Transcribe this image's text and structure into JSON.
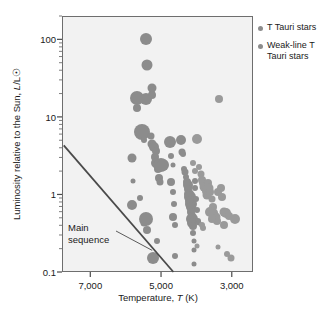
{
  "chart_data": {
    "type": "scatter",
    "title": "",
    "xlabel": "Temperature, T (K)",
    "ylabel": "Luminosity relative to the Sun, L/L☉",
    "xlabel_parts": {
      "pre": "Temperature, ",
      "sym": "T",
      "post": " (K)"
    },
    "ylabel_parts": {
      "pre": "Luminosity relative to the Sun, ",
      "sym": "L",
      "post": "/L☉"
    },
    "xscale": "linear",
    "yscale": "log",
    "x_inverted": true,
    "xlim": [
      7800,
      2400
    ],
    "ylim": [
      0.1,
      200
    ],
    "grid": false,
    "xticks": [
      7000,
      5000,
      3000
    ],
    "xtick_labels": [
      "7,000",
      "5,000",
      "3,000"
    ],
    "yticks": [
      0.1,
      1,
      10,
      100
    ],
    "ytick_labels": [
      "0.1",
      "1",
      "10",
      "100"
    ],
    "y_minor_ticks": [
      0.2,
      0.3,
      0.4,
      0.5,
      0.6,
      0.7,
      0.8,
      0.9,
      2,
      3,
      4,
      5,
      6,
      7,
      8,
      9,
      20,
      30,
      40,
      50,
      60,
      70,
      80,
      90,
      200
    ],
    "legend_position": "right-top",
    "legend": [
      {
        "name": "T Tauri stars",
        "color": "#8c8c8c"
      },
      {
        "name": "Weak-line T Tauri stars",
        "color": "#9a9a9a"
      }
    ],
    "annotations": [
      {
        "text_line1": "Main",
        "text_line2": "sequence",
        "points_to": [
          5250,
          0.19
        ]
      }
    ],
    "main_sequence_line": {
      "x": [
        7750,
        4650
      ],
      "y": [
        4.3,
        0.1
      ]
    },
    "series": [
      {
        "name": "T Tauri stars",
        "color": "#8c8c8c",
        "points": [
          {
            "x": 5450,
            "y": 105,
            "s": 6
          },
          {
            "x": 5430,
            "y": 48,
            "s": 5.5
          },
          {
            "x": 5700,
            "y": 18,
            "s": 7
          },
          {
            "x": 5700,
            "y": 13.5,
            "s": 4
          },
          {
            "x": 5450,
            "y": 17.5,
            "s": 6
          },
          {
            "x": 5270,
            "y": 24,
            "s": 4.5
          },
          {
            "x": 5270,
            "y": 20,
            "s": 4
          },
          {
            "x": 5560,
            "y": 6.6,
            "s": 8
          },
          {
            "x": 5520,
            "y": 5.2,
            "s": 3
          },
          {
            "x": 5300,
            "y": 5.8,
            "s": 3.5
          },
          {
            "x": 5280,
            "y": 4.6,
            "s": 4.5
          },
          {
            "x": 5230,
            "y": 4.2,
            "s": 5
          },
          {
            "x": 5180,
            "y": 3.7,
            "s": 4
          },
          {
            "x": 5210,
            "y": 3.1,
            "s": 4
          },
          {
            "x": 5160,
            "y": 2.6,
            "s": 5
          },
          {
            "x": 5120,
            "y": 2.2,
            "s": 4
          },
          {
            "x": 5080,
            "y": 2.5,
            "s": 6
          },
          {
            "x": 5020,
            "y": 2.45,
            "s": 7
          },
          {
            "x": 4980,
            "y": 2.5,
            "s": 6
          },
          {
            "x": 5100,
            "y": 1.7,
            "s": 4
          },
          {
            "x": 5060,
            "y": 1.5,
            "s": 3.5
          },
          {
            "x": 5840,
            "y": 3.0,
            "s": 4.5
          },
          {
            "x": 5830,
            "y": 1.55,
            "s": 2.5
          },
          {
            "x": 5850,
            "y": 0.75,
            "s": 5
          },
          {
            "x": 5620,
            "y": 0.93,
            "s": 3
          },
          {
            "x": 5520,
            "y": 0.44,
            "s": 3.5
          },
          {
            "x": 5440,
            "y": 0.5,
            "s": 7
          },
          {
            "x": 5420,
            "y": 0.36,
            "s": 4
          },
          {
            "x": 5260,
            "y": 0.155,
            "s": 6
          },
          {
            "x": 5150,
            "y": 0.26,
            "s": 3
          },
          {
            "x": 4780,
            "y": 4.9,
            "s": 6
          },
          {
            "x": 4760,
            "y": 3.2,
            "s": 3
          },
          {
            "x": 4700,
            "y": 2.5,
            "s": 2.5
          },
          {
            "x": 4740,
            "y": 1.5,
            "s": 4
          },
          {
            "x": 4700,
            "y": 1.1,
            "s": 3
          },
          {
            "x": 4660,
            "y": 0.78,
            "s": 3
          },
          {
            "x": 4690,
            "y": 0.52,
            "s": 4
          },
          {
            "x": 4640,
            "y": 0.42,
            "s": 3
          },
          {
            "x": 4620,
            "y": 0.165,
            "s": 3
          },
          {
            "x": 4450,
            "y": 5.2,
            "s": 5
          },
          {
            "x": 4430,
            "y": 3.6,
            "s": 3.5
          },
          {
            "x": 4400,
            "y": 3.4,
            "s": 3
          },
          {
            "x": 4380,
            "y": 2.2,
            "s": 3
          },
          {
            "x": 4350,
            "y": 2.0,
            "s": 3.5
          },
          {
            "x": 4330,
            "y": 1.75,
            "s": 3
          },
          {
            "x": 4300,
            "y": 1.5,
            "s": 4
          },
          {
            "x": 4280,
            "y": 1.35,
            "s": 5
          },
          {
            "x": 4260,
            "y": 1.2,
            "s": 4
          },
          {
            "x": 4240,
            "y": 1.05,
            "s": 5
          },
          {
            "x": 4220,
            "y": 0.95,
            "s": 6
          },
          {
            "x": 4200,
            "y": 0.85,
            "s": 5
          },
          {
            "x": 4190,
            "y": 0.78,
            "s": 6
          },
          {
            "x": 4180,
            "y": 0.72,
            "s": 5
          },
          {
            "x": 4170,
            "y": 0.62,
            "s": 4
          },
          {
            "x": 4160,
            "y": 0.55,
            "s": 4
          },
          {
            "x": 4150,
            "y": 0.5,
            "s": 6
          },
          {
            "x": 4140,
            "y": 0.44,
            "s": 5
          },
          {
            "x": 4130,
            "y": 0.4,
            "s": 4
          },
          {
            "x": 4120,
            "y": 0.33,
            "s": 3
          },
          {
            "x": 4110,
            "y": 0.26,
            "s": 2.5
          },
          {
            "x": 4100,
            "y": 0.2,
            "s": 2.5
          },
          {
            "x": 4090,
            "y": 0.13,
            "s": 2.5
          },
          {
            "x": 4080,
            "y": 1.55,
            "s": 3
          },
          {
            "x": 4060,
            "y": 1.25,
            "s": 3
          },
          {
            "x": 4040,
            "y": 0.9,
            "s": 3
          },
          {
            "x": 4020,
            "y": 0.64,
            "s": 3
          },
          {
            "x": 3990,
            "y": 0.47,
            "s": 3
          },
          {
            "x": 3960,
            "y": 0.44,
            "s": 2.5
          }
        ]
      },
      {
        "name": "Weak-line T Tauri stars",
        "color": "#9a9a9a",
        "points": [
          {
            "x": 3380,
            "y": 17.5,
            "s": 4
          },
          {
            "x": 4010,
            "y": 5.3,
            "s": 5
          },
          {
            "x": 3960,
            "y": 2.35,
            "s": 3
          },
          {
            "x": 3900,
            "y": 1.9,
            "s": 3.5
          },
          {
            "x": 3870,
            "y": 1.6,
            "s": 4
          },
          {
            "x": 3840,
            "y": 1.45,
            "s": 4
          },
          {
            "x": 3800,
            "y": 1.3,
            "s": 4.5
          },
          {
            "x": 3770,
            "y": 1.15,
            "s": 4
          },
          {
            "x": 3740,
            "y": 1.0,
            "s": 4.5
          },
          {
            "x": 3700,
            "y": 1.45,
            "s": 4
          },
          {
            "x": 3660,
            "y": 1.25,
            "s": 4.5
          },
          {
            "x": 3630,
            "y": 1.1,
            "s": 4
          },
          {
            "x": 3600,
            "y": 0.9,
            "s": 3.5
          },
          {
            "x": 3560,
            "y": 0.72,
            "s": 4
          },
          {
            "x": 3520,
            "y": 0.6,
            "s": 4
          },
          {
            "x": 3480,
            "y": 0.52,
            "s": 4.5
          },
          {
            "x": 3440,
            "y": 0.47,
            "s": 4
          },
          {
            "x": 3640,
            "y": 0.62,
            "s": 5
          },
          {
            "x": 3600,
            "y": 0.5,
            "s": 4
          },
          {
            "x": 3420,
            "y": 1.1,
            "s": 4
          },
          {
            "x": 3340,
            "y": 1.25,
            "s": 4
          },
          {
            "x": 3300,
            "y": 0.95,
            "s": 4
          },
          {
            "x": 3250,
            "y": 0.62,
            "s": 4.5
          },
          {
            "x": 3180,
            "y": 0.6,
            "s": 5
          },
          {
            "x": 3100,
            "y": 0.55,
            "s": 4
          },
          {
            "x": 2950,
            "y": 0.5,
            "s": 5
          },
          {
            "x": 3240,
            "y": 0.42,
            "s": 4
          },
          {
            "x": 3160,
            "y": 0.175,
            "s": 3
          },
          {
            "x": 3060,
            "y": 0.155,
            "s": 3.5
          },
          {
            "x": 3420,
            "y": 0.215,
            "s": 2.5
          },
          {
            "x": 4010,
            "y": 0.22,
            "s": 2.5
          },
          {
            "x": 3880,
            "y": 0.42,
            "s": 3
          },
          {
            "x": 3830,
            "y": 0.38,
            "s": 3
          },
          {
            "x": 4120,
            "y": 2.6,
            "s": 3
          },
          {
            "x": 4060,
            "y": 2.05,
            "s": 3
          }
        ]
      }
    ]
  }
}
